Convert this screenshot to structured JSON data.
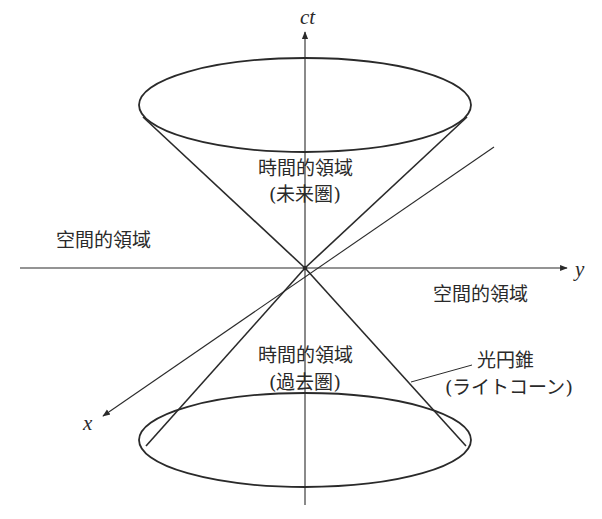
{
  "diagram": {
    "axes": {
      "time": "ct",
      "y": "y",
      "x": "x"
    },
    "labels": {
      "future_region_line1": "時間的領域",
      "future_region_line2": "(未来圏)",
      "past_region_line1": "時間的領域",
      "past_region_line2": "(過去圏)",
      "space_region_left": "空間的領域",
      "space_region_right": "空間的領域",
      "light_cone_line1": "光円錐",
      "light_cone_line2": "(ライトコーン)"
    },
    "caption": "",
    "colors": {
      "stroke": "#2a2a2a",
      "background": "#ffffff"
    }
  }
}
